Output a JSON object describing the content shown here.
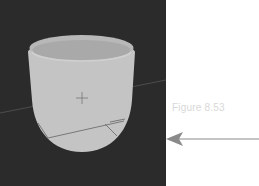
{
  "figure": {
    "caption": "Figure 8.53"
  },
  "viewport": {
    "background": "#2b2b2b",
    "object_fill": "#c4c4c4",
    "object_rim_inner": "#a9a9a9",
    "line_color": "#6f6f6f"
  },
  "annotation": {
    "arrow_direction": "left",
    "arrow_color": "#8a8a8a"
  }
}
